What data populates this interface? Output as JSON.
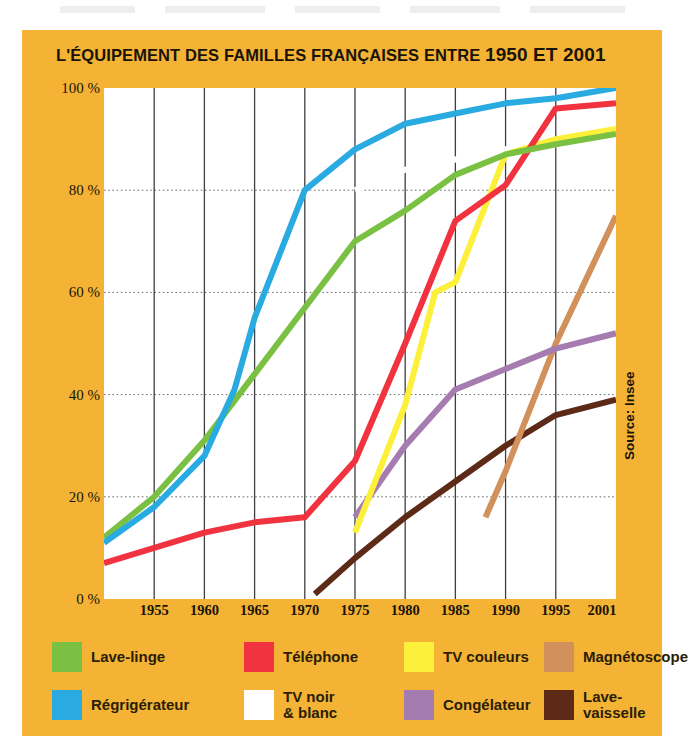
{
  "panel": {
    "background_color": "#f4b335",
    "title_prefix": "L'ÉQUIPEMENT DES FAMILLES FRANÇAISES ENTRE ",
    "title_years": "1950 ET 2001",
    "title_full": "L'ÉQUIPEMENT DES FAMILLES FRANÇAISES ENTRE 1950 ET 2001",
    "source": "Source: Insee"
  },
  "legend": {
    "row1": [
      {
        "label": "Lave-linge",
        "color": "#7ac043"
      },
      {
        "label": "Téléphone",
        "color": "#f0333f"
      },
      {
        "label": "TV couleurs",
        "color": "#fdf03a"
      },
      {
        "label": "Magnétoscope",
        "color": "#d2905a"
      }
    ],
    "row2": [
      {
        "label": "Régrigérateur",
        "color": "#29abe2"
      },
      {
        "label": "TV noir\n& blanc",
        "color": "#ffffff"
      },
      {
        "label": "Congélateur",
        "color": "#a57bb0"
      },
      {
        "label": "Lave-vaisselle",
        "color": "#5c2a16"
      }
    ]
  },
  "chart_data": {
    "type": "line",
    "title": "L'ÉQUIPEMENT DES FAMILLES FRANÇAISES ENTRE 1950 ET 2001",
    "xlabel": "",
    "ylabel": "",
    "xlim": [
      1950,
      2001
    ],
    "ylim": [
      0,
      100
    ],
    "xticks": [
      1955,
      1960,
      1965,
      1970,
      1975,
      1980,
      1985,
      1990,
      1995,
      2001
    ],
    "xtick_labels": [
      "1955",
      "1960",
      "1965",
      "1970",
      "1975",
      "1980",
      "1985",
      "1990",
      "1995",
      "2001"
    ],
    "yticks": [
      0,
      20,
      40,
      60,
      80,
      100
    ],
    "ytick_labels": [
      "0 %",
      "20 %",
      "40 %",
      "60 %",
      "80 %",
      "100 %"
    ],
    "grid": "dotted horizontal gridlines + solid vertical year lines",
    "legend_position": "below-plot",
    "unit": "%",
    "series": [
      {
        "name": "Régrigérateur",
        "color": "#29abe2",
        "x": [
          1950,
          1955,
          1960,
          1963,
          1965,
          1970,
          1975,
          1980,
          1985,
          1990,
          1995,
          2001
        ],
        "y": [
          11,
          18,
          28,
          41,
          55,
          80,
          88,
          93,
          95,
          97,
          98,
          100
        ]
      },
      {
        "name": "Lave-linge",
        "color": "#7ac043",
        "x": [
          1950,
          1955,
          1960,
          1965,
          1970,
          1975,
          1980,
          1985,
          1990,
          1995,
          2001
        ],
        "y": [
          12,
          20,
          31,
          44,
          57,
          70,
          76,
          83,
          87,
          89,
          91
        ]
      },
      {
        "name": "Téléphone",
        "color": "#f0333f",
        "x": [
          1950,
          1955,
          1960,
          1965,
          1970,
          1975,
          1980,
          1985,
          1990,
          1995,
          2001
        ],
        "y": [
          7,
          10,
          13,
          15,
          16,
          27,
          50,
          74,
          81,
          96,
          97
        ]
      },
      {
        "name": "TV couleurs",
        "color": "#fdf03a",
        "x": [
          1975,
          1980,
          1983,
          1985,
          1990,
          1995,
          2001
        ],
        "y": [
          13,
          38,
          60,
          62,
          87,
          90,
          92
        ]
      },
      {
        "name": "Congélateur",
        "color": "#a57bb0",
        "x": [
          1975,
          1980,
          1985,
          1990,
          1995,
          2001
        ],
        "y": [
          16,
          30,
          41,
          45,
          49,
          52
        ]
      },
      {
        "name": "Lave-vaisselle",
        "color": "#5c2a16",
        "x": [
          1971,
          1975,
          1980,
          1985,
          1990,
          1995,
          2001
        ],
        "y": [
          1,
          8,
          16,
          23,
          30,
          36,
          39
        ]
      },
      {
        "name": "Magnétoscope",
        "color": "#d2905a",
        "x": [
          1988,
          1990,
          1995,
          2001
        ],
        "y": [
          16,
          25,
          50,
          75
        ]
      },
      {
        "name": "TV noir & blanc",
        "color": "#ffffff",
        "x": [
          1975,
          1980,
          1985,
          1990,
          1995,
          2001
        ],
        "y": [
          80,
          84,
          86,
          88,
          89,
          90
        ]
      }
    ]
  }
}
